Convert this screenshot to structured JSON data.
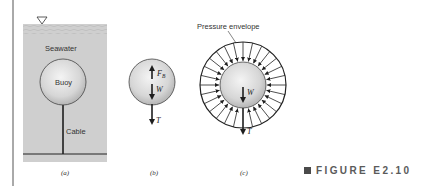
{
  "figure": {
    "caption_label": "FIGURE E2.10",
    "panels": {
      "a": {
        "label": "(a)",
        "medium_label": "Seawater",
        "buoy_label": "Buoy",
        "cable_label": "Cable"
      },
      "b": {
        "label": "(b)",
        "forces": {
          "buoyancy": "F",
          "buoyancy_sub": "B",
          "weight": "W",
          "tension": "T"
        }
      },
      "c": {
        "label": "(c)",
        "envelope_label": "Pressure envelope",
        "forces": {
          "weight": "W",
          "tension": "T"
        }
      }
    }
  },
  "colors": {
    "water": "#cfcfcf",
    "buoy_fill_center": "#f2f2f2",
    "buoy_fill_edge": "#b9b9b9",
    "line": "#2a2a2a",
    "caption": "#5a5a5a"
  }
}
